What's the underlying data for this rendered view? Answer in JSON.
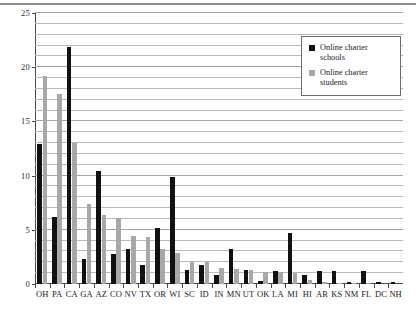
{
  "chart_data": {
    "type": "bar",
    "title": "",
    "subtitle": "",
    "xlabel": "",
    "ylabel": "",
    "ylim": [
      0,
      25
    ],
    "yticks": [
      0,
      5,
      10,
      15,
      20,
      25
    ],
    "grid": true,
    "grid_minor_step": 1,
    "legend_position": "top-right",
    "categories": [
      "OH",
      "PA",
      "CA",
      "GA",
      "AZ",
      "CO",
      "NV",
      "TX",
      "OR",
      "WI",
      "SC",
      "ID",
      "IN",
      "MN",
      "UT",
      "OK",
      "LA",
      "MI",
      "HI",
      "AR",
      "KS",
      "NM",
      "FL",
      "DC",
      "NH"
    ],
    "series": [
      {
        "name": "Online charter schools",
        "color": "#111111",
        "values": [
          12.9,
          6.2,
          21.9,
          2.3,
          10.4,
          2.8,
          3.2,
          1.8,
          5.2,
          9.9,
          1.3,
          1.8,
          0.8,
          3.2,
          1.3,
          0.3,
          1.2,
          4.7,
          0.8,
          1.2,
          1.2,
          0.2,
          1.2,
          0.2,
          0.2
        ]
      },
      {
        "name": "Online charter students",
        "color": "#a8a8a8",
        "values": [
          19.2,
          17.5,
          13.0,
          7.4,
          6.4,
          6.1,
          4.4,
          4.3,
          3.2,
          2.9,
          2.0,
          2.0,
          1.5,
          1.4,
          1.3,
          1.1,
          1.1,
          1.0,
          0.4,
          0.2,
          0.1,
          0.1,
          0.05,
          0.0,
          0.0
        ]
      }
    ]
  },
  "legend": {
    "entries": [
      {
        "label_line1": "Online charter",
        "label_line2": "schools",
        "swatch": "schools"
      },
      {
        "label_line1": "Online charter",
        "label_line2": "students",
        "swatch": "students"
      }
    ]
  },
  "axis": {
    "y_tick_labels": [
      "0",
      "5",
      "10",
      "15",
      "20",
      "25"
    ]
  },
  "colors": {
    "schools": "#111111",
    "students": "#a8a8a8",
    "grid": "#b9b9b9",
    "axis": "#4a4a4a",
    "background": "#ffffff"
  }
}
